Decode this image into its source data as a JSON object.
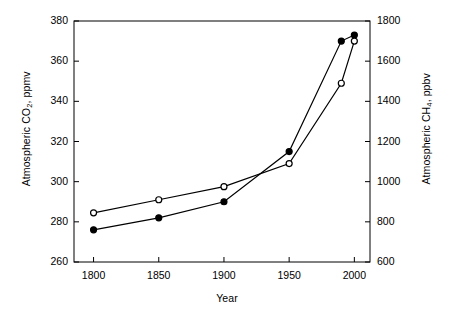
{
  "chart_data": {
    "type": "line",
    "title": "",
    "subtitle": "",
    "xlabel": "Year",
    "x": [
      1800,
      1850,
      1900,
      1950,
      1990,
      2000
    ],
    "xlim": [
      1785,
      2012
    ],
    "xticks": [
      1800,
      1850,
      1900,
      1950,
      2000
    ],
    "xticklabels": [
      "1800",
      "1850",
      "1900",
      "1950",
      "2000"
    ],
    "grid": false,
    "legend": "none",
    "series": [
      {
        "name": "Atmospheric CO2, ppmv",
        "axis": "left",
        "marker": "filled-circle",
        "marker_fill": "#000000",
        "line_color": "#000000",
        "x": [
          1800,
          1850,
          1900,
          1950,
          1990,
          2000
        ],
        "values": [
          276,
          282,
          290,
          315,
          370,
          373
        ]
      },
      {
        "name": "Atmospheric CH4, ppbv",
        "axis": "right",
        "marker": "open-circle",
        "marker_fill": "#ffffff",
        "line_color": "#000000",
        "x": [
          1800,
          1850,
          1900,
          1950,
          1990,
          2000
        ],
        "values": [
          845,
          910,
          975,
          1090,
          1490,
          1700
        ]
      }
    ],
    "left_axis": {
      "label_prefix": "Atmospheric CO",
      "label_sub": "2",
      "label_suffix": ", ppmv",
      "ylim": [
        260,
        380
      ],
      "yticks": [
        260,
        280,
        300,
        320,
        340,
        360,
        380
      ],
      "yticklabels": [
        "260",
        "280",
        "300",
        "320",
        "340",
        "360",
        "380"
      ]
    },
    "right_axis": {
      "label_prefix": "Atmospheric CH",
      "label_sub": "4",
      "label_suffix": ", ppbv",
      "ylim": [
        600,
        1800
      ],
      "yticks": [
        600,
        800,
        1000,
        1200,
        1400,
        1600,
        1800
      ],
      "yticklabels": [
        "600",
        "800",
        "1000",
        "1200",
        "1400",
        "1600",
        "1800"
      ]
    },
    "style": {
      "frame_color": "#000000",
      "background": "#ffffff",
      "line_width": 1.2,
      "marker_size": 6
    }
  }
}
